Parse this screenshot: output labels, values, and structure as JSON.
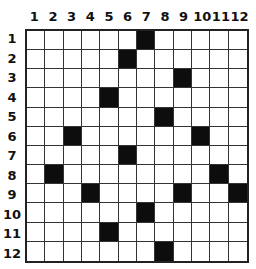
{
  "grid": {
    "rows": 12,
    "cols": 12,
    "column_labels": [
      "1",
      "2",
      "3",
      "4",
      "5",
      "6",
      "7",
      "8",
      "9",
      "10",
      "11",
      "12"
    ],
    "row_labels": [
      "1",
      "2",
      "3",
      "4",
      "5",
      "6",
      "7",
      "8",
      "9",
      "10",
      "11",
      "12"
    ],
    "filled_cells": [
      [
        1,
        7
      ],
      [
        2,
        6
      ],
      [
        3,
        9
      ],
      [
        4,
        5
      ],
      [
        5,
        8
      ],
      [
        6,
        3
      ],
      [
        6,
        10
      ],
      [
        7,
        6
      ],
      [
        8,
        2
      ],
      [
        8,
        11
      ],
      [
        9,
        4
      ],
      [
        9,
        9
      ],
      [
        9,
        12
      ],
      [
        10,
        7
      ],
      [
        11,
        5
      ],
      [
        12,
        8
      ]
    ],
    "colors": {
      "filled": "#0d0d0d",
      "empty": "#ffffff",
      "line": "#333333"
    }
  }
}
